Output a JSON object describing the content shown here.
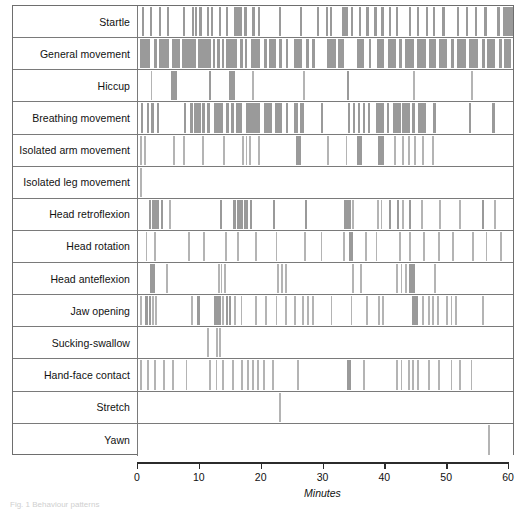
{
  "figure": {
    "type": "ethogram",
    "caption_fragment": "Fig. 1 Behaviour patterns",
    "axis": {
      "title": "Minutes",
      "ticks": [
        0,
        10,
        20,
        30,
        40,
        50,
        60
      ],
      "min": 0,
      "max": 60
    },
    "colors": {
      "event_bar": "#9a9a9a",
      "event_bar_light": "#b4b4b4",
      "grid_line": "#7a7a7a",
      "frame": "#6e6e6e",
      "axis": "#2b2b2b"
    }
  },
  "chart_data": {
    "type": "bar",
    "title": "",
    "xlabel": "Minutes",
    "ylabel": "",
    "xlim": [
      0,
      60
    ],
    "grid": false,
    "legend": "none",
    "categories": [
      "Startle",
      "General movement",
      "Hiccup",
      "Breathing movement",
      "Isolated arm movement",
      "Isolated leg movement",
      "Head retroflexion",
      "Head rotation",
      "Head anteflexion",
      "Jaw opening",
      "Sucking-swallow",
      "Hand-face contact",
      "Stretch",
      "Yawn"
    ],
    "series": [
      {
        "name": "Startle",
        "events": [
          [
            0.6,
            0.35
          ],
          [
            1.9,
            0.35
          ],
          [
            3.3,
            0.35
          ],
          [
            4.6,
            0.35
          ],
          [
            7.2,
            0.35
          ],
          [
            8.6,
            0.4
          ],
          [
            9.1,
            0.4
          ],
          [
            9.7,
            0.5
          ],
          [
            11.0,
            0.4
          ],
          [
            11.7,
            0.35
          ],
          [
            12.9,
            0.4
          ],
          [
            14.0,
            0.35
          ],
          [
            15.4,
            1.3
          ],
          [
            17.0,
            0.5
          ],
          [
            18.3,
            0.4
          ],
          [
            19.2,
            0.4
          ],
          [
            22.6,
            0.35
          ],
          [
            25.9,
            0.35
          ],
          [
            28.6,
            0.35
          ],
          [
            30.0,
            0.35
          ],
          [
            30.7,
            0.35
          ],
          [
            32.7,
            0.9
          ],
          [
            34.0,
            0.4
          ],
          [
            35.3,
            0.4
          ],
          [
            36.5,
            0.4
          ],
          [
            37.8,
            0.4
          ],
          [
            38.9,
            0.4
          ],
          [
            40.1,
            0.4
          ],
          [
            41.2,
            0.4
          ],
          [
            43.3,
            0.4
          ],
          [
            44.6,
            0.4
          ],
          [
            46.0,
            0.45
          ],
          [
            47.2,
            0.4
          ],
          [
            48.7,
            0.4
          ],
          [
            51.0,
            0.4
          ],
          [
            52.4,
            0.4
          ],
          [
            53.9,
            0.4
          ],
          [
            55.4,
            0.4
          ],
          [
            57.5,
            0.4
          ],
          [
            58.4,
            0.5
          ],
          [
            58.9,
            1.4
          ]
        ]
      },
      {
        "name": "General movement",
        "events": [
          [
            0.4,
            1.6
          ],
          [
            2.6,
            0.45
          ],
          [
            3.4,
            1.6
          ],
          [
            5.4,
            1.3
          ],
          [
            7.0,
            2.2
          ],
          [
            9.6,
            2.0
          ],
          [
            12.0,
            0.4
          ],
          [
            12.7,
            0.35
          ],
          [
            13.4,
            0.35
          ],
          [
            14.1,
            1.8
          ],
          [
            16.3,
            0.45
          ],
          [
            17.1,
            0.4
          ],
          [
            18.0,
            1.6
          ],
          [
            20.1,
            0.5
          ],
          [
            21.0,
            1.1
          ],
          [
            22.6,
            0.4
          ],
          [
            23.6,
            0.45
          ],
          [
            25.0,
            1.3
          ],
          [
            26.9,
            0.4
          ],
          [
            27.8,
            0.45
          ],
          [
            30.2,
            1.4
          ],
          [
            32.0,
            1.0
          ],
          [
            35.0,
            1.2
          ],
          [
            36.9,
            0.45
          ],
          [
            38.2,
            1.2
          ],
          [
            40.0,
            1.3
          ],
          [
            41.8,
            0.45
          ],
          [
            42.7,
            1.4
          ],
          [
            44.6,
            1.4
          ],
          [
            46.6,
            1.1
          ],
          [
            48.2,
            1.3
          ],
          [
            50.1,
            0.45
          ],
          [
            51.0,
            1.5
          ],
          [
            53.0,
            1.4
          ],
          [
            55.0,
            0.45
          ],
          [
            55.9,
            1.3
          ],
          [
            57.8,
            0.45
          ],
          [
            58.6,
            1.0
          ]
        ]
      },
      {
        "name": "Hiccup",
        "events": [
          [
            2.0,
            0.3
          ],
          [
            5.3,
            0.9
          ],
          [
            11.4,
            0.35
          ],
          [
            14.6,
            0.9
          ],
          [
            18.3,
            0.3
          ],
          [
            26.4,
            0.3
          ],
          [
            33.4,
            0.35
          ],
          [
            44.0,
            0.3
          ],
          [
            53.3,
            0.3
          ]
        ]
      },
      {
        "name": "Breathing movement",
        "events": [
          [
            0.5,
            0.35
          ],
          [
            1.4,
            0.35
          ],
          [
            2.0,
            0.5
          ],
          [
            3.0,
            0.35
          ],
          [
            7.3,
            0.35
          ],
          [
            8.3,
            0.45
          ],
          [
            9.0,
            1.0
          ],
          [
            10.3,
            0.45
          ],
          [
            11.1,
            0.35
          ],
          [
            12.2,
            1.4
          ],
          [
            14.0,
            0.5
          ],
          [
            14.9,
            0.45
          ],
          [
            15.7,
            1.0
          ],
          [
            17.2,
            2.3
          ],
          [
            20.2,
            1.3
          ],
          [
            21.9,
            1.2
          ],
          [
            23.6,
            0.4
          ],
          [
            25.0,
            0.6
          ],
          [
            25.9,
            0.6
          ],
          [
            29.2,
            0.35
          ],
          [
            33.6,
            0.35
          ],
          [
            34.4,
            0.4
          ],
          [
            35.2,
            0.4
          ],
          [
            36.0,
            0.4
          ],
          [
            36.8,
            0.4
          ],
          [
            38.0,
            1.4
          ],
          [
            39.8,
            0.4
          ],
          [
            40.8,
            1.2
          ],
          [
            42.3,
            1.2
          ],
          [
            43.9,
            0.4
          ],
          [
            44.8,
            1.2
          ],
          [
            47.2,
            0.5
          ],
          [
            53.0,
            0.35
          ],
          [
            56.7,
            0.35
          ]
        ]
      },
      {
        "name": "Isolated arm movement",
        "events": [
          [
            0.4,
            0.3
          ],
          [
            0.9,
            0.3
          ],
          [
            5.6,
            0.3
          ],
          [
            7.2,
            0.3
          ],
          [
            10.2,
            0.3
          ],
          [
            13.6,
            0.3
          ],
          [
            16.6,
            0.3
          ],
          [
            17.2,
            0.3
          ],
          [
            17.8,
            0.3
          ],
          [
            19.2,
            0.3
          ],
          [
            25.2,
            0.9
          ],
          [
            30.2,
            0.3
          ],
          [
            33.2,
            0.3
          ],
          [
            35.0,
            0.9
          ],
          [
            38.4,
            1.0
          ],
          [
            41.0,
            0.3
          ],
          [
            42.3,
            0.3
          ],
          [
            43.2,
            0.3
          ],
          [
            44.2,
            0.3
          ],
          [
            45.5,
            0.3
          ],
          [
            47.0,
            0.3
          ]
        ]
      },
      {
        "name": "Isolated leg movement",
        "events": [
          [
            0.4,
            0.3
          ]
        ]
      },
      {
        "name": "Head retroflexion",
        "events": [
          [
            1.8,
            0.35
          ],
          [
            2.3,
            1.0
          ],
          [
            3.6,
            0.35
          ],
          [
            4.9,
            0.3
          ],
          [
            13.1,
            0.35
          ],
          [
            15.2,
            0.45
          ],
          [
            15.9,
            0.9
          ],
          [
            17.0,
            0.6
          ],
          [
            17.9,
            0.35
          ],
          [
            21.6,
            0.35
          ],
          [
            26.7,
            0.35
          ],
          [
            33.0,
            1.0
          ],
          [
            34.3,
            0.3
          ],
          [
            38.2,
            0.3
          ],
          [
            38.8,
            0.3
          ],
          [
            40.2,
            0.35
          ],
          [
            41.4,
            0.35
          ],
          [
            42.3,
            0.3
          ],
          [
            43.4,
            0.35
          ],
          [
            45.3,
            0.3
          ],
          [
            48.2,
            0.3
          ],
          [
            51.4,
            0.3
          ],
          [
            55.0,
            0.35
          ],
          [
            57.0,
            0.3
          ]
        ]
      },
      {
        "name": "Head rotation",
        "events": [
          [
            1.2,
            0.3
          ],
          [
            2.6,
            0.3
          ],
          [
            8.0,
            0.3
          ],
          [
            10.4,
            0.3
          ],
          [
            13.9,
            0.3
          ],
          [
            15.9,
            0.3
          ],
          [
            18.7,
            0.3
          ],
          [
            22.0,
            0.3
          ],
          [
            26.5,
            0.3
          ],
          [
            29.2,
            0.3
          ],
          [
            32.8,
            0.3
          ],
          [
            33.8,
            0.6
          ],
          [
            36.3,
            0.3
          ],
          [
            38.0,
            0.3
          ],
          [
            41.7,
            0.3
          ],
          [
            43.3,
            0.3
          ],
          [
            45.6,
            0.3
          ],
          [
            48.0,
            0.3
          ],
          [
            50.2,
            0.3
          ],
          [
            53.4,
            0.3
          ],
          [
            55.6,
            0.3
          ],
          [
            57.9,
            0.3
          ]
        ]
      },
      {
        "name": "Head anteflexion",
        "events": [
          [
            1.9,
            0.5
          ],
          [
            2.4,
            0.35
          ],
          [
            4.5,
            0.3
          ],
          [
            12.8,
            0.3
          ],
          [
            13.2,
            0.3
          ],
          [
            13.7,
            0.3
          ],
          [
            22.3,
            0.3
          ],
          [
            22.9,
            0.3
          ],
          [
            23.5,
            0.3
          ],
          [
            34.2,
            0.3
          ],
          [
            35.5,
            0.3
          ],
          [
            41.3,
            0.3
          ],
          [
            42.0,
            0.3
          ],
          [
            42.7,
            0.3
          ],
          [
            43.4,
            0.9
          ],
          [
            47.4,
            0.3
          ]
        ]
      },
      {
        "name": "Jaw opening",
        "events": [
          [
            0.4,
            0.3
          ],
          [
            1.1,
            0.5
          ],
          [
            1.7,
            0.35
          ],
          [
            2.2,
            0.3
          ],
          [
            2.7,
            0.3
          ],
          [
            8.5,
            0.3
          ],
          [
            9.5,
            0.35
          ],
          [
            12.2,
            1.0
          ],
          [
            13.5,
            0.3
          ],
          [
            14.0,
            0.35
          ],
          [
            14.6,
            0.35
          ],
          [
            15.3,
            0.3
          ],
          [
            16.4,
            0.3
          ],
          [
            18.7,
            0.3
          ],
          [
            20.3,
            0.3
          ],
          [
            22.0,
            0.3
          ],
          [
            23.5,
            0.3
          ],
          [
            25.0,
            0.3
          ],
          [
            26.3,
            0.3
          ],
          [
            27.1,
            0.3
          ],
          [
            27.8,
            0.3
          ],
          [
            30.8,
            0.3
          ],
          [
            34.0,
            0.3
          ],
          [
            36.5,
            0.3
          ],
          [
            38.4,
            0.3
          ],
          [
            39.0,
            0.3
          ],
          [
            43.9,
            0.9
          ],
          [
            45.4,
            0.3
          ],
          [
            46.4,
            0.3
          ],
          [
            47.1,
            0.3
          ],
          [
            47.8,
            0.3
          ],
          [
            49.3,
            0.3
          ],
          [
            50.0,
            0.3
          ],
          [
            50.7,
            0.3
          ],
          [
            55.0,
            0.3
          ]
        ]
      },
      {
        "name": "Sucking-swallow",
        "events": [
          [
            11.0,
            0.3
          ],
          [
            12.5,
            0.3
          ],
          [
            13.0,
            0.3
          ]
        ]
      },
      {
        "name": "Hand-face contact",
        "events": [
          [
            0.4,
            0.3
          ],
          [
            1.4,
            0.3
          ],
          [
            2.6,
            0.3
          ],
          [
            4.0,
            0.3
          ],
          [
            5.4,
            0.3
          ],
          [
            7.6,
            0.3
          ],
          [
            11.3,
            0.3
          ],
          [
            12.4,
            0.3
          ],
          [
            13.5,
            0.3
          ],
          [
            15.0,
            0.3
          ],
          [
            16.5,
            0.3
          ],
          [
            17.5,
            0.3
          ],
          [
            18.3,
            0.3
          ],
          [
            19.1,
            0.3
          ],
          [
            20.0,
            0.3
          ],
          [
            21.4,
            0.3
          ],
          [
            25.4,
            0.3
          ],
          [
            33.4,
            0.6
          ],
          [
            36.0,
            0.3
          ],
          [
            41.3,
            0.3
          ],
          [
            42.0,
            0.3
          ],
          [
            43.2,
            0.3
          ],
          [
            43.9,
            0.3
          ],
          [
            44.7,
            0.3
          ],
          [
            46.4,
            0.3
          ],
          [
            48.0,
            0.3
          ],
          [
            50.0,
            0.3
          ],
          [
            51.4,
            0.3
          ],
          [
            53.2,
            0.3
          ]
        ]
      },
      {
        "name": "Stretch",
        "events": [
          [
            22.5,
            0.3
          ]
        ]
      },
      {
        "name": "Yawn",
        "events": [
          [
            56.0,
            0.3
          ]
        ]
      }
    ]
  }
}
